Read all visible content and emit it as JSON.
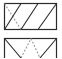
{
  "figure": {
    "canvas": {
      "width": 62,
      "height": 58
    },
    "background_color": "#ffffff",
    "stroke_color": "#2b2b2b",
    "dashed_stroke_color": "#9a9a9a",
    "frame_stroke_width": 1.2,
    "diagonal_stroke_width": 1.1,
    "dash_pattern": "2,1.6",
    "panels": [
      {
        "name": "top-panel",
        "label": "",
        "rect": {
          "x": 4.5,
          "y": 3.5,
          "width": 52,
          "height": 26
        },
        "solid_edges": [
          {
            "name": "left-rising-diagonal",
            "x1": 4.5,
            "y1": 29.5,
            "x2": 21.0,
            "y2": 3.5
          },
          {
            "name": "middle-rising-diagonal",
            "x1": 21.0,
            "y1": 29.5,
            "x2": 38.0,
            "y2": 3.5
          },
          {
            "name": "right-rising-diagonal",
            "x1": 38.0,
            "y1": 29.5,
            "x2": 56.5,
            "y2": 3.5
          }
        ],
        "dashed_edges": [
          {
            "name": "falling-dashed-diagonal",
            "x1": 4.5,
            "y1": 3.5,
            "x2": 21.0,
            "y2": 29.5
          }
        ]
      },
      {
        "name": "bottom-panel",
        "label": "",
        "rect": {
          "x": 4.5,
          "y": 38.5,
          "width": 52,
          "height": 26
        },
        "solid_edges": [
          {
            "name": "left-falling-diagonal",
            "x1": 4.5,
            "y1": 38.5,
            "x2": 21.0,
            "y2": 58.0
          },
          {
            "name": "right-falling-diagonal",
            "x1": 56.5,
            "y1": 38.5,
            "x2": 40.0,
            "y2": 58.0
          }
        ],
        "dashed_edges": [
          {
            "name": "center-rising-dashed-diagonal",
            "x1": 21.0,
            "y1": 58.0,
            "x2": 31.0,
            "y2": 38.5
          },
          {
            "name": "center-falling-dashed-diagonal",
            "x1": 31.0,
            "y1": 38.5,
            "x2": 40.0,
            "y2": 58.0
          }
        ]
      }
    ]
  }
}
